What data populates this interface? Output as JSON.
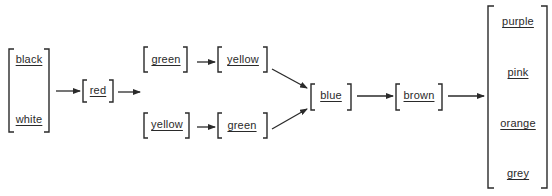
{
  "diagram": {
    "colors": {
      "ink": "#2a2a2a",
      "background": "#ffffff"
    },
    "nodes": {
      "start_group": {
        "items": [
          "black",
          "white"
        ]
      },
      "red": {
        "label": "red"
      },
      "upper_first": {
        "label": "green"
      },
      "upper_second": {
        "label": "yellow"
      },
      "lower_first": {
        "label": "yellow"
      },
      "lower_second": {
        "label": "green"
      },
      "blue": {
        "label": "blue"
      },
      "brown": {
        "label": "brown"
      },
      "end_group": {
        "items": [
          "purple",
          "pink",
          "orange",
          "grey"
        ]
      }
    },
    "edges": [
      {
        "from": "start_group",
        "to": "red"
      },
      {
        "from": "red",
        "to": "branch"
      },
      {
        "from": "upper_first",
        "to": "upper_second"
      },
      {
        "from": "upper_second",
        "to": "blue"
      },
      {
        "from": "lower_first",
        "to": "lower_second"
      },
      {
        "from": "lower_second",
        "to": "blue"
      },
      {
        "from": "blue",
        "to": "brown"
      },
      {
        "from": "brown",
        "to": "end_group"
      }
    ]
  }
}
